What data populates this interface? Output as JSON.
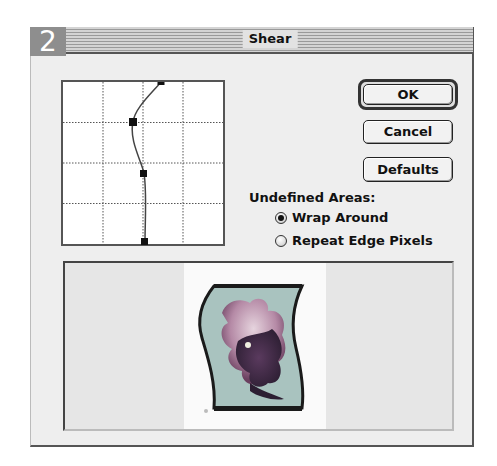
{
  "badge": "2",
  "window": {
    "title": "Shear"
  },
  "graph": {
    "grid": {
      "rows": 4,
      "cols": 4
    },
    "points": [
      {
        "x": 0.61,
        "y": 0.0
      },
      {
        "x": 0.43,
        "y": 0.25
      },
      {
        "x": 0.5,
        "y": 0.56
      },
      {
        "x": 0.51,
        "y": 0.99
      }
    ]
  },
  "buttons": {
    "ok": "OK",
    "cancel": "Cancel",
    "defaults": "Defaults"
  },
  "undefined_areas": {
    "label": "Undefined Areas:",
    "options": [
      {
        "label": "Wrap Around",
        "selected": true
      },
      {
        "label": "Repeat Edge Pixels",
        "selected": false
      }
    ]
  },
  "preview": {
    "description": "Sheared flower photo preview",
    "colors": {
      "frame": "#1a1a1a",
      "background": "#a9c3bf",
      "flower_light": "#c6a3b8",
      "flower_dark": "#3d2a44"
    }
  }
}
